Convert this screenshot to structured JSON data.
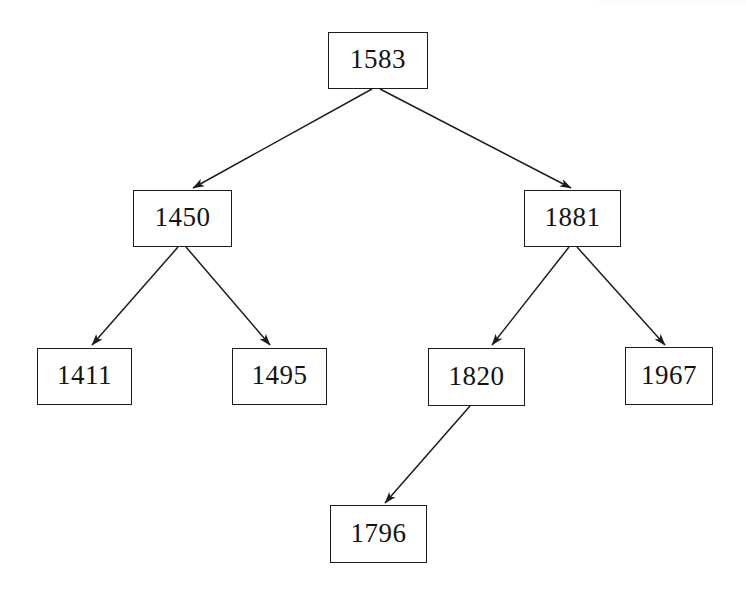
{
  "diagram": {
    "kind": "binary-search-tree",
    "title": "",
    "background_color": "#ffffff",
    "line_color": "#1c1c1c",
    "text_color": "#131313",
    "nodes": [
      {
        "id": "n1583",
        "label": "1583",
        "x": 328,
        "y": 32,
        "width": 100,
        "height": 57,
        "level": 0,
        "role": "root"
      },
      {
        "id": "n1450",
        "label": "1450",
        "x": 133,
        "y": 190,
        "width": 99,
        "height": 57,
        "level": 1,
        "role": "left-child"
      },
      {
        "id": "n1881",
        "label": "1881",
        "x": 524,
        "y": 190,
        "width": 97,
        "height": 57,
        "level": 1,
        "role": "right-child"
      },
      {
        "id": "n1411",
        "label": "1411",
        "x": 37,
        "y": 348,
        "width": 95,
        "height": 57,
        "level": 2,
        "role": "leaf"
      },
      {
        "id": "n1495",
        "label": "1495",
        "x": 232,
        "y": 348,
        "width": 95,
        "height": 57,
        "level": 2,
        "role": "leaf"
      },
      {
        "id": "n1820",
        "label": "1820",
        "x": 428,
        "y": 348,
        "width": 97,
        "height": 58,
        "level": 2,
        "role": "internal"
      },
      {
        "id": "n1967",
        "label": "1967",
        "x": 625,
        "y": 347,
        "width": 88,
        "height": 58,
        "level": 2,
        "role": "leaf"
      },
      {
        "id": "n1796",
        "label": "1796",
        "x": 330,
        "y": 505,
        "width": 97,
        "height": 58,
        "level": 3,
        "role": "leaf"
      }
    ],
    "edges": [
      {
        "from": "n1583",
        "to": "n1450",
        "x1": 372,
        "y1": 89,
        "x2": 193,
        "y2": 188,
        "arrow": true
      },
      {
        "from": "n1583",
        "to": "n1881",
        "x1": 380,
        "y1": 89,
        "x2": 571,
        "y2": 188,
        "arrow": true
      },
      {
        "from": "n1450",
        "to": "n1411",
        "x1": 178,
        "y1": 247,
        "x2": 92,
        "y2": 345,
        "arrow": true
      },
      {
        "from": "n1450",
        "to": "n1495",
        "x1": 186,
        "y1": 247,
        "x2": 270,
        "y2": 345,
        "arrow": true
      },
      {
        "from": "n1881",
        "to": "n1820",
        "x1": 569,
        "y1": 247,
        "x2": 492,
        "y2": 345,
        "arrow": true
      },
      {
        "from": "n1881",
        "to": "n1967",
        "x1": 577,
        "y1": 247,
        "x2": 665,
        "y2": 345,
        "arrow": true
      },
      {
        "from": "n1820",
        "to": "n1796",
        "x1": 470,
        "y1": 406,
        "x2": 385,
        "y2": 503,
        "arrow": true
      }
    ]
  }
}
